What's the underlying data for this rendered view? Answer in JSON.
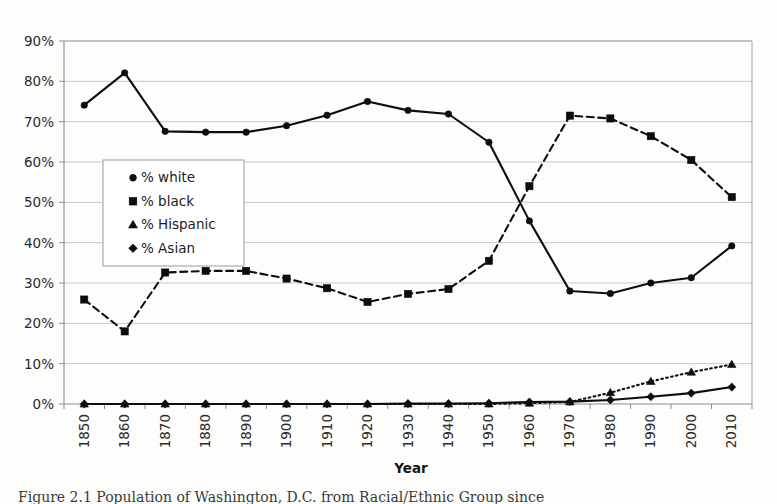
{
  "figure": {
    "caption": "Figure 2.1   Population of Washington, D.C. from Racial/Ethnic Group since"
  },
  "chart_data": {
    "type": "line",
    "title": "",
    "xlabel": "Year",
    "ylabel": "",
    "ylim": [
      0,
      90
    ],
    "ytick_labels": [
      "0%",
      "10%",
      "20%",
      "30%",
      "40%",
      "50%",
      "60%",
      "70%",
      "80%",
      "90%"
    ],
    "ytick_values": [
      0,
      10,
      20,
      30,
      40,
      50,
      60,
      70,
      80,
      90
    ],
    "grid": true,
    "legend_position": "inside-upper-left",
    "categories": [
      1850,
      1860,
      1870,
      1880,
      1890,
      1900,
      1910,
      1920,
      1930,
      1940,
      1950,
      1960,
      1970,
      1980,
      1990,
      2000,
      2010
    ],
    "xtick_labels": [
      "1850",
      "1860",
      "1870",
      "1880",
      "1890",
      "1900",
      "1910",
      "1920",
      "1930",
      "1940",
      "1950",
      "1960",
      "1970",
      "1980",
      "1990",
      "2000",
      "2010"
    ],
    "series": [
      {
        "name": "% white",
        "marker": "circle",
        "line_style": "solid",
        "color": "#0d0d0d",
        "values": [
          74.1,
          82.1,
          67.6,
          67.4,
          67.4,
          69.0,
          71.6,
          75.0,
          72.8,
          71.9,
          64.9,
          45.4,
          28.0,
          27.4,
          30.0,
          31.3,
          39.2
        ]
      },
      {
        "name": "% black",
        "marker": "square",
        "line_style": "dashed",
        "color": "#0d0d0d",
        "values": [
          25.9,
          18.0,
          32.6,
          33.0,
          33.0,
          31.1,
          28.7,
          25.3,
          27.3,
          28.5,
          35.5,
          54.0,
          71.5,
          70.8,
          66.4,
          60.5,
          51.3
        ]
      },
      {
        "name": "% Hispanic",
        "marker": "triangle",
        "line_style": "dotted",
        "color": "#0d0d0d",
        "values": [
          0.0,
          0.0,
          0.0,
          0.0,
          0.0,
          0.0,
          0.0,
          0.0,
          0.0,
          0.0,
          0.0,
          0.2,
          0.5,
          2.8,
          5.6,
          7.9,
          9.8
        ]
      },
      {
        "name": "% Asian",
        "marker": "diamond",
        "line_style": "solid",
        "color": "#0d0d0d",
        "values": [
          0.0,
          0.0,
          0.0,
          0.0,
          0.0,
          0.0,
          0.0,
          0.0,
          0.1,
          0.1,
          0.2,
          0.5,
          0.6,
          1.0,
          1.8,
          2.7,
          4.2
        ]
      }
    ]
  },
  "legend": {
    "items": [
      {
        "label": "% white",
        "marker": "circle"
      },
      {
        "label": "% black",
        "marker": "square"
      },
      {
        "label": "% Hispanic",
        "marker": "triangle"
      },
      {
        "label": "% Asian",
        "marker": "diamond"
      }
    ]
  }
}
